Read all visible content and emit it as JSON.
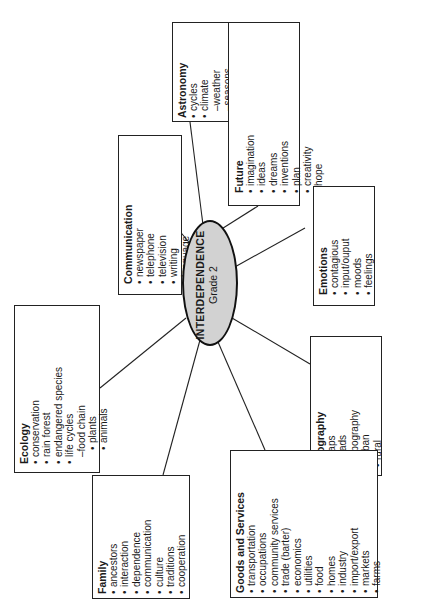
{
  "center": {
    "title": "INTERDEPENDENCE",
    "subtitle": "Grade 2",
    "fill": "#d2d2d2"
  },
  "topics": {
    "astronomy": {
      "title": "Astronomy",
      "items": [
        {
          "text": "cycles",
          "level": "bullet"
        },
        {
          "text": "climate",
          "level": "bullet"
        },
        {
          "text": "–weather",
          "level": "dash"
        },
        {
          "text": "–seasons",
          "level": "dash"
        }
      ]
    },
    "future": {
      "title": "Future",
      "items": [
        {
          "text": "imagination",
          "level": "bullet"
        },
        {
          "text": "ideas",
          "level": "bullet"
        },
        {
          "text": "dreams",
          "level": "bullet"
        },
        {
          "text": "inventions",
          "level": "bullet"
        },
        {
          "text": "plan",
          "level": "bullet"
        },
        {
          "text": "creativity",
          "level": "bullet"
        },
        {
          "text": "hope",
          "level": "bullet"
        }
      ]
    },
    "communication": {
      "title": "Communication",
      "items": [
        {
          "text": "newspaper",
          "level": "bullet"
        },
        {
          "text": "telephone",
          "level": "bullet"
        },
        {
          "text": "television",
          "level": "bullet"
        },
        {
          "text": "writing",
          "level": "bullet"
        },
        {
          "text": "language",
          "level": "bullet"
        },
        {
          "text": "roads",
          "level": "bullet"
        },
        {
          "text": "technology",
          "level": "bullet"
        }
      ]
    },
    "emotions": {
      "title": "Emotions",
      "items": [
        {
          "text": "contagious",
          "level": "bullet"
        },
        {
          "text": "input/ouput",
          "level": "bullet"
        },
        {
          "text": "moods",
          "level": "bullet"
        },
        {
          "text": "feelings",
          "level": "bullet"
        }
      ]
    },
    "ecology": {
      "title": "Ecology",
      "items": [
        {
          "text": "conservation",
          "level": "bullet"
        },
        {
          "text": "rain forest",
          "level": "bullet"
        },
        {
          "text": "endangered species",
          "level": "bullet"
        },
        {
          "text": "life cycles",
          "level": "bullet"
        },
        {
          "text": "–food chain",
          "level": "dash"
        },
        {
          "text": "plants",
          "level": "subbullet"
        },
        {
          "text": "animals",
          "level": "subbullet"
        }
      ]
    },
    "geography": {
      "title": "Geography",
      "items": [
        {
          "text": "maps",
          "level": "bullet"
        },
        {
          "text": "roads",
          "level": "bullet"
        },
        {
          "text": "topography",
          "level": "bullet"
        },
        {
          "text": "urban",
          "level": "bullet"
        },
        {
          "text": "rural",
          "level": "bullet"
        }
      ]
    },
    "family": {
      "title": "Family",
      "items": [
        {
          "text": "ancestors",
          "level": "bullet"
        },
        {
          "text": "interaction",
          "level": "bullet"
        },
        {
          "text": "dependence",
          "level": "bullet"
        },
        {
          "text": "communication",
          "level": "bullet"
        },
        {
          "text": "culture",
          "level": "bullet"
        },
        {
          "text": "traditions",
          "level": "bullet"
        },
        {
          "text": "cooperation",
          "level": "bullet"
        }
      ]
    },
    "goods": {
      "title": "Goods and Services",
      "items": [
        {
          "text": "transportation",
          "level": "bullet"
        },
        {
          "text": "occupations",
          "level": "bullet"
        },
        {
          "text": "community services",
          "level": "bullet"
        },
        {
          "text": "trade (barter)",
          "level": "bullet"
        },
        {
          "text": "economics",
          "level": "bullet"
        },
        {
          "text": "utilities",
          "level": "bullet"
        },
        {
          "text": "food",
          "level": "bullet"
        },
        {
          "text": "homes",
          "level": "bullet"
        },
        {
          "text": "industry",
          "level": "bullet"
        },
        {
          "text": "import/export",
          "level": "bullet"
        },
        {
          "text": "markets",
          "level": "bullet"
        },
        {
          "text": "farms",
          "level": "bullet"
        }
      ]
    }
  }
}
